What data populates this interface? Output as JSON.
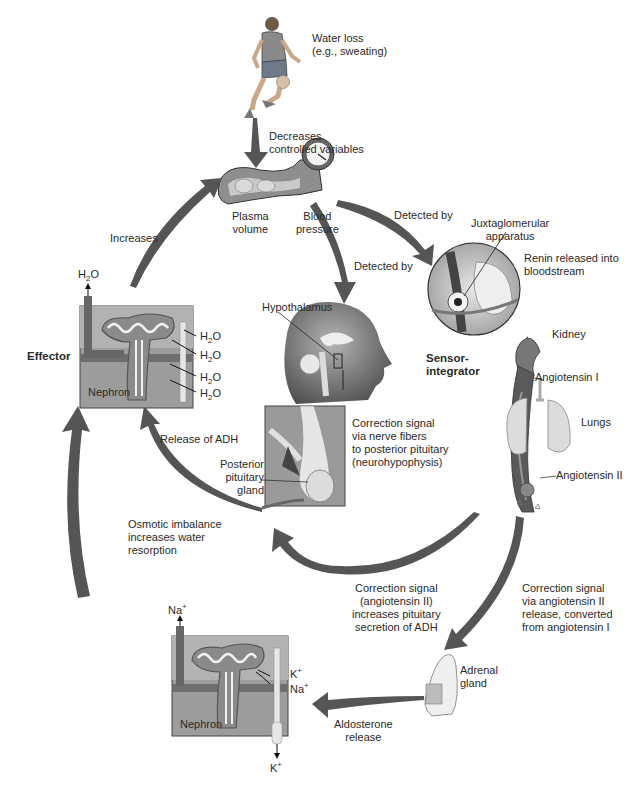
{
  "diagram": {
    "colors": {
      "arrow": "#4a4a4a",
      "tissue_gray": "#8f8f8f",
      "light_gray": "#d9d9d9",
      "dark_gray": "#555555",
      "background": "#ffffff"
    },
    "nodes": {
      "stimulus": {
        "label": "Water loss\n(e.g., sweating)",
        "icon": "basketball-player-icon"
      },
      "controlled_variables": {
        "plasma_volume": "Plasma\nvolume",
        "blood_pressure": "Blood\npressure",
        "icon": "blood-vessel-gauge-icon"
      },
      "juxtaglomerular": {
        "label": "Juxtaglomerular\napparatus",
        "renin": "Renin released into\nbloodstream"
      },
      "kidney": {
        "label": "Kidney"
      },
      "sensor_integrator": {
        "label": "Sensor-\nintegrator"
      },
      "angiotensin_1": {
        "label": "Angiotensin I"
      },
      "lungs": {
        "label": "Lungs"
      },
      "angiotensin_2": {
        "label": "Angiotensin II"
      },
      "hypothalamus": {
        "label": "Hypothalamus"
      },
      "posterior_pituitary": {
        "label": "Posterior\npituitary\ngland"
      },
      "effector": {
        "label": "Effector"
      },
      "nephron_top": {
        "label": "Nephron",
        "out": {
          "base": "H",
          "sub": "2",
          "tail": "O"
        },
        "in": [
          {
            "base": "H",
            "sub": "2",
            "tail": "O"
          },
          {
            "base": "H",
            "sub": "2",
            "tail": "O"
          },
          {
            "base": "H",
            "sub": "2",
            "tail": "O"
          },
          {
            "base": "H",
            "sub": "2",
            "tail": "O"
          }
        ]
      },
      "nephron_bottom": {
        "label": "Nephron",
        "out_top": {
          "base": "Na",
          "sup": "+"
        },
        "ions_in": [
          {
            "base": "K",
            "sup": "+"
          },
          {
            "base": "Na",
            "sup": "+"
          }
        ],
        "out_bottom": {
          "base": "K",
          "sup": "+"
        }
      },
      "adrenal": {
        "label": "Adrenal\ngland"
      }
    },
    "arrows": {
      "decreases": "Decreases\ncontrolled variables",
      "detected_by_right": "Detected by",
      "detected_by_down": "Detected by",
      "increases": "Increases",
      "release_adh": "Release of ADH",
      "nerve_signal": "Correction signal\nvia nerve fibers\nto posterior pituitary\n(neurohypophysis)",
      "osmotic": "Osmotic imbalance\nincreases water\nresorption",
      "angiotensin_adh": "Correction signal\n(angiotensin II)\nincreases pituitary\nsecretion of ADH",
      "angiotensin_adrenal": "Correction signal\nvia angiotensin II\nrelease, converted\nfrom angiotensin I",
      "aldosterone": "Aldosterone\nrelease"
    }
  }
}
